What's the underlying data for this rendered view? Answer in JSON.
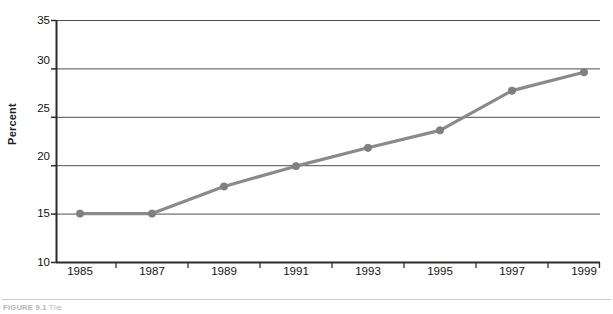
{
  "chart_data": {
    "type": "line",
    "title": "",
    "xlabel": "Year",
    "ylabel": "Percent",
    "categories": [
      "1985",
      "1987",
      "1989",
      "1991",
      "1993",
      "1995",
      "1997",
      "1999"
    ],
    "x": [
      1985,
      1987,
      1989,
      1991,
      1993,
      1995,
      1997,
      1999
    ],
    "values": [
      15.0,
      15.0,
      17.8,
      19.9,
      21.8,
      23.6,
      27.7,
      29.6
    ],
    "series": [
      {
        "name": "Percent",
        "values": [
          15.0,
          15.0,
          17.8,
          19.9,
          21.8,
          23.6,
          27.7,
          29.6
        ],
        "color": "#8a8a8a",
        "marker": "circle"
      }
    ],
    "ylim": [
      10,
      35
    ],
    "yticks": [
      10,
      15,
      20,
      25,
      30,
      35
    ],
    "ytick_labels": [
      "10",
      "15",
      "20",
      "25",
      "30",
      "35"
    ],
    "xtick_labels": [
      "1985",
      "1987",
      "1989",
      "1991",
      "1993",
      "1995",
      "1997",
      "1999"
    ],
    "grid": "horizontal",
    "grid_color": "#4d4d4d",
    "legend": "none",
    "axis_color": "#2b2b2b",
    "line_color": "#8a8a8a",
    "marker_color": "#7f7f7f"
  },
  "caption": {
    "figure_number": "FIGURE 9.1",
    "text": "The"
  }
}
